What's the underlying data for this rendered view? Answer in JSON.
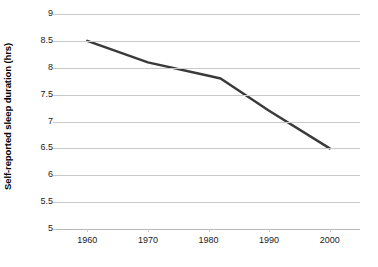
{
  "chart_data": {
    "type": "line",
    "title": "",
    "subtitle": "",
    "xlabel": "",
    "ylabel": "Self-reported sleep duration (hrs)",
    "x": [
      1960,
      1970,
      1980,
      1982,
      1990,
      2000
    ],
    "series": [
      {
        "name": "Self-reported sleep duration",
        "values": [
          8.5,
          8.1,
          7.85,
          7.8,
          7.2,
          6.5
        ],
        "color": "#3a3a3a",
        "line_width": 2.5,
        "markers": false
      }
    ],
    "xlim": [
      1955,
      2005
    ],
    "ylim": [
      5,
      9
    ],
    "x_ticks": [
      1960,
      1970,
      1980,
      1990,
      2000
    ],
    "x_tick_labels": [
      "1960",
      "1970",
      "1980",
      "1990",
      "2000"
    ],
    "y_ticks": [
      5,
      5.5,
      6,
      6.5,
      7,
      7.5,
      8,
      8.5,
      9
    ],
    "y_tick_labels": [
      "5",
      "5.5",
      "6",
      "6.5",
      "7",
      "7.5",
      "8",
      "8.5",
      "9"
    ],
    "grid": {
      "horizontal": true,
      "vertical": false,
      "color": "#c9c9c9"
    },
    "legend": {
      "visible": false,
      "position": "none"
    },
    "annotations": [],
    "background_color": "#ffffff",
    "axis_color": "#b8b8b8"
  }
}
